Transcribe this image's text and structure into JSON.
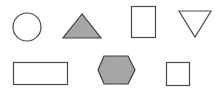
{
  "colors": {
    "background": "#ffffff",
    "stroke": "#4a4a4a",
    "filled": "#a6a6a6",
    "unfilled": "#ffffff"
  },
  "shapes": [
    {
      "id": "circle",
      "type": "circle",
      "filled": false,
      "row": 1,
      "col": 1
    },
    {
      "id": "triangle-up",
      "type": "triangle",
      "orientation": "up",
      "filled": true,
      "row": 1,
      "col": 2
    },
    {
      "id": "rectangle-portrait",
      "type": "rectangle",
      "orientation": "portrait",
      "filled": false,
      "row": 1,
      "col": 3
    },
    {
      "id": "triangle-down",
      "type": "triangle",
      "orientation": "down",
      "filled": false,
      "row": 1,
      "col": 4
    },
    {
      "id": "rectangle-landscape",
      "type": "rectangle",
      "orientation": "landscape",
      "filled": false,
      "row": 2,
      "col": 1
    },
    {
      "id": "hexagon",
      "type": "hexagon",
      "filled": true,
      "row": 2,
      "col": 2
    },
    {
      "id": "square",
      "type": "square",
      "filled": false,
      "row": 2,
      "col": 3
    }
  ]
}
